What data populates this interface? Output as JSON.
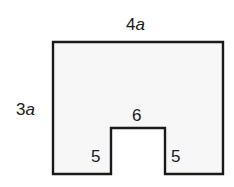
{
  "figure": {
    "type": "notched-rectangle",
    "fill_color": "#f7f7f7",
    "stroke_color": "#1a1a1a",
    "labels": {
      "top_width": {
        "num": "4",
        "var": "a"
      },
      "left_height": {
        "num": "3",
        "var": "a"
      },
      "notch_width": "6",
      "notch_left_height": "5",
      "notch_right_height": "5"
    }
  }
}
